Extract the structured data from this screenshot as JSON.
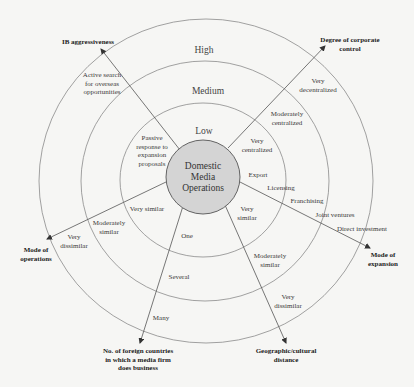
{
  "diagram": {
    "center": {
      "label": "Domestic\nMedia\nOperations",
      "fill": "#d4d4d4"
    },
    "rings": [
      {
        "label": "Low"
      },
      {
        "label": "Medium"
      },
      {
        "label": "High"
      }
    ],
    "axes": [
      {
        "id": "ib-aggressiveness",
        "title": "IB aggressiveness",
        "levels": [
          "Passive\nresponse to\nexpansion\nproposals",
          "Active search\nfor overseas\nopportunities"
        ]
      },
      {
        "id": "corporate-control",
        "title": "Degree of corporate\ncontrol",
        "levels": [
          "Very\ncentralized",
          "Moderately\ncentralized",
          "Very\ndecentralized"
        ]
      },
      {
        "id": "mode-of-expansion",
        "title": "Mode of\nexpansion",
        "levels": [
          "Export",
          "Licensing",
          "Franchising",
          "Joint ventures",
          "Direct investment"
        ]
      },
      {
        "id": "geographic-cultural-distance",
        "title": "Geographic/cultural\ndistance",
        "levels": [
          "Very\nsimilar",
          "Moderately\nsimilar",
          "Very\ndissimilar"
        ]
      },
      {
        "id": "foreign-countries",
        "title": "No. of foreign countries\nin which a media firm\ndoes business",
        "levels": [
          "One",
          "Several",
          "Many"
        ]
      },
      {
        "id": "mode-of-operations",
        "title": "Mode of\noperations",
        "levels": [
          "Very similar",
          "Moderately\nsimilar",
          "Very\ndissimilar"
        ]
      }
    ],
    "colors": {
      "line": "#555555",
      "ring": "#8a8a8a",
      "background": "#f6f6f4"
    }
  }
}
